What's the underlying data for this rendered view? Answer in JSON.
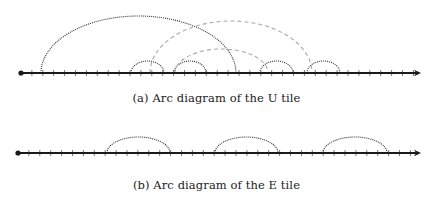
{
  "figure": {
    "panels": [
      {
        "id": "a",
        "caption": "(a) Arc diagram of the U tile",
        "axis": {
          "y": 73,
          "x_start": 21,
          "x_end": 421,
          "tick_spacing": 10.9,
          "start_dot": true,
          "arrow_end": true
        },
        "arcs": [
          {
            "style": "dotted",
            "x1": 41,
            "x2": 236,
            "peak_y": 16
          },
          {
            "style": "dotted",
            "x1": 131,
            "x2": 164,
            "peak_y": 61
          },
          {
            "style": "dotted",
            "x1": 174,
            "x2": 206,
            "peak_y": 61
          },
          {
            "style": "dotted",
            "x1": 260,
            "x2": 293,
            "peak_y": 61
          },
          {
            "style": "dotted",
            "x1": 307,
            "x2": 340,
            "peak_y": 61
          },
          {
            "style": "dashed",
            "x1": 150,
            "x2": 312,
            "peak_y": 21
          },
          {
            "style": "dashed",
            "x1": 175,
            "x2": 268,
            "peak_y": 49
          }
        ]
      },
      {
        "id": "b",
        "caption": "(b) Arc diagram of the E tile",
        "axis": {
          "y": 153,
          "x_start": 18,
          "x_end": 421,
          "tick_spacing": 10.9,
          "start_dot": true,
          "arrow_end": true
        },
        "arcs": [
          {
            "style": "dotted",
            "x1": 107,
            "x2": 170,
            "peak_y": 137
          },
          {
            "style": "dotted",
            "x1": 215,
            "x2": 278,
            "peak_y": 137
          },
          {
            "style": "dotted",
            "x1": 323,
            "x2": 387,
            "peak_y": 137
          }
        ]
      }
    ],
    "colors": {
      "axis": "#1a1a1a",
      "dotted_arc": "#333333",
      "dashed_arc": "#a8a8a8",
      "tick": "#555555"
    }
  }
}
